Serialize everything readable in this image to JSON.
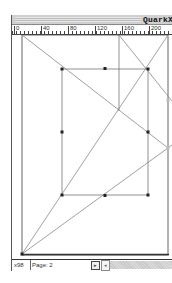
{
  "window": {
    "title": "QuarkX"
  },
  "ruler": {
    "labels": [
      "0",
      "40",
      "80",
      "120",
      "160",
      "200"
    ]
  },
  "canvas": {
    "page_frame": {
      "x1": 10,
      "y1": 14,
      "x2": 156,
      "y2": 233
    },
    "box": {
      "x1": 50,
      "y1": 48,
      "x2": 136,
      "y2": 174
    },
    "handles": [
      {
        "x": 50,
        "y": 48
      },
      {
        "x": 93,
        "y": 47
      },
      {
        "x": 136,
        "y": 48
      },
      {
        "x": 50,
        "y": 111
      },
      {
        "x": 136,
        "y": 111
      },
      {
        "x": 50,
        "y": 174
      },
      {
        "x": 93,
        "y": 175
      },
      {
        "x": 136,
        "y": 174
      }
    ]
  },
  "statusbar": {
    "zoom": "x98",
    "page_label": "Page: 2",
    "page_button": "▸",
    "scroll_left": "◂"
  }
}
